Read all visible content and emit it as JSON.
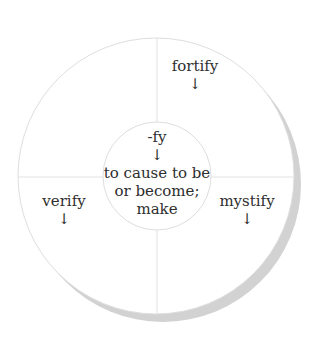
{
  "diagram": {
    "type": "word-wheel",
    "colors": {
      "background": "#ffffff",
      "circle_fill": "#ffffff",
      "circle_stroke": "#dedede",
      "divider_stroke": "#e2e2e2",
      "shadow": "#d2d2d2",
      "text": "#2e2e2e"
    },
    "center": {
      "suffix": "-fy",
      "arrow": "↓",
      "meaning_lines": [
        "to cause to be",
        "or become;",
        "make"
      ]
    },
    "words": [
      {
        "position": "top-right",
        "word": "fortify",
        "arrow": "↓"
      },
      {
        "position": "bottom-left",
        "word": "verify",
        "arrow": "↓"
      },
      {
        "position": "bottom-right",
        "word": "mystify",
        "arrow": "↓"
      }
    ]
  }
}
